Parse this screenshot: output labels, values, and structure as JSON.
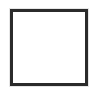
{
  "canvas": {
    "width": 95,
    "height": 94,
    "background_color": "#ffffff"
  },
  "shape": {
    "name": "square-outline",
    "kind": "rectangle",
    "label": "",
    "stroke_color": "#2b2b2b",
    "stroke_width_px": 3,
    "fill_color": "#ffffff",
    "corner_style": "sharp",
    "left_px": 10,
    "top_px": 9,
    "width_px": 78,
    "height_px": 77,
    "halo_color": "#e6e6e6",
    "interior_text": ""
  }
}
